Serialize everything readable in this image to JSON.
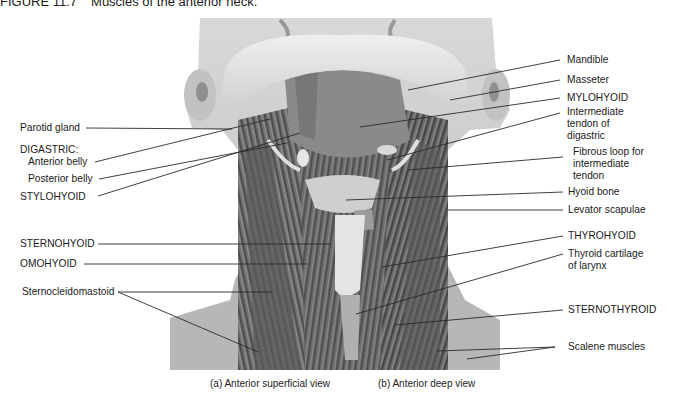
{
  "figure": {
    "number": "FIGURE 11.7",
    "title": "Muscles of the anterior neck."
  },
  "labels_left": {
    "parotid_gland": "Parotid gland",
    "digastric_heading": "DIGASTRIC:",
    "anterior_belly": "Anterior belly",
    "posterior_belly": "Posterior belly",
    "stylohyoid": "STYLOHYOID",
    "sternohyoid": "STERNOHYOID",
    "omohyoid": "OMOHYOID",
    "sternocleidomastoid": "Sternocleidomastoid"
  },
  "labels_right": {
    "mandible": "Mandible",
    "masseter": "Masseter",
    "mylohyoid": "MYLOHYOID",
    "intermediate_tendon_1": "Intermediate",
    "intermediate_tendon_2": "tendon of",
    "intermediate_tendon_3": "digastric",
    "fibrous_loop_1": "Fibrous loop for",
    "fibrous_loop_2": "intermediate",
    "fibrous_loop_3": "tendon",
    "hyoid_bone": "Hyoid bone",
    "levator_scapulae": "Levator scapulae",
    "thyrohyoid": "THYROHYOID",
    "thyroid_cartilage_1": "Thyroid cartilage",
    "thyroid_cartilage_2": "of larynx",
    "sternothyroid": "STERNOTHYROID",
    "scalene_muscles": "Scalene muscles"
  },
  "captions": {
    "a": "(a) Anterior superficial view",
    "b": "(b) Anterior deep view"
  },
  "colors": {
    "background": "#ffffff",
    "text": "#1a1a1a",
    "leader_line": "#2a2a2a",
    "skin": "#cfcfcf",
    "shoulder": "#b5b5b5",
    "muscle_dark": "#5a5a5a",
    "muscle_mid": "#7d7d7d",
    "muscle_light": "#a3a3a3",
    "bone": "#e2e2e2"
  }
}
